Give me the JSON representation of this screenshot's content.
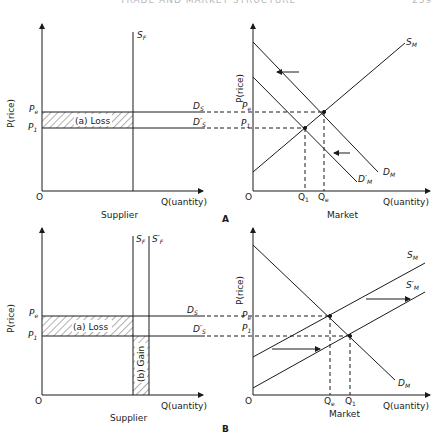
{
  "header": {
    "title": "TRADE AND MARKET STRUCTURE",
    "page": "259"
  },
  "panels": [
    {
      "id": "A",
      "label": "A",
      "supplier": {
        "caption": "Supplier",
        "y_axis_label": "P(rice)",
        "x_axis_label": "Q(uantity)",
        "origin": "O",
        "price_labels": {
          "pe": "P",
          "pe_sub": "e",
          "p1": "P",
          "p1_sub": "1"
        },
        "supply_curve": {
          "label": "S",
          "sub": "F"
        },
        "demand_labels": {
          "ds": "D",
          "ds_sub": "S",
          "ds_prime": "D′",
          "ds_prime_sub": "S"
        },
        "shaded_region": "(a) Loss"
      },
      "market": {
        "caption": "Market",
        "y_axis_label": "P(rice)",
        "x_axis_label": "Q(uantity)",
        "origin": "O",
        "price_labels": {
          "pe": "P",
          "pe_sub": "e",
          "p1": "P",
          "p1_sub": "1"
        },
        "quantity_labels": {
          "q1": "Q",
          "q1_sub": "1",
          "qe": "Q",
          "qe_sub": "e"
        },
        "curves": {
          "sm": "S",
          "sm_sub": "M",
          "dm": "D",
          "dm_sub": "M",
          "dm_prime": "D′",
          "dm_prime_sub": "M"
        }
      }
    },
    {
      "id": "B",
      "label": "B",
      "supplier": {
        "caption": "Supplier",
        "y_axis_label": "P(rice)",
        "x_axis_label": "Q(uantity)",
        "origin": "O",
        "price_labels": {
          "pe": "P",
          "pe_sub": "e",
          "p1": "P",
          "p1_sub": "1"
        },
        "supply_curves": {
          "sf": "S",
          "sf_sub": "F",
          "sf_prime": "S′",
          "sf_prime_sub": "F"
        },
        "demand_labels": {
          "ds": "D",
          "ds_sub": "S",
          "ds_prime": "D′",
          "ds_prime_sub": "S"
        },
        "shaded_regions": {
          "loss": "(a) Loss",
          "gain": "(b) Gain"
        }
      },
      "market": {
        "caption": "Market",
        "y_axis_label": "P(rice)",
        "x_axis_label": "Q(uantity)",
        "origin": "O",
        "price_labels": {
          "pe": "P",
          "pe_sub": "e",
          "p1": "P",
          "p1_sub": "1"
        },
        "quantity_labels": {
          "qe": "Q",
          "qe_sub": "e",
          "q1": "Q",
          "q1_sub": "1"
        },
        "curves": {
          "sm": "S",
          "sm_sub": "M",
          "sm_prime": "S′",
          "sm_prime_sub": "M",
          "dm": "D",
          "dm_sub": "M"
        }
      }
    }
  ],
  "colors": {
    "ink": "#1a1a1a",
    "background": "#ffffff",
    "header": "#b8b8b8"
  }
}
